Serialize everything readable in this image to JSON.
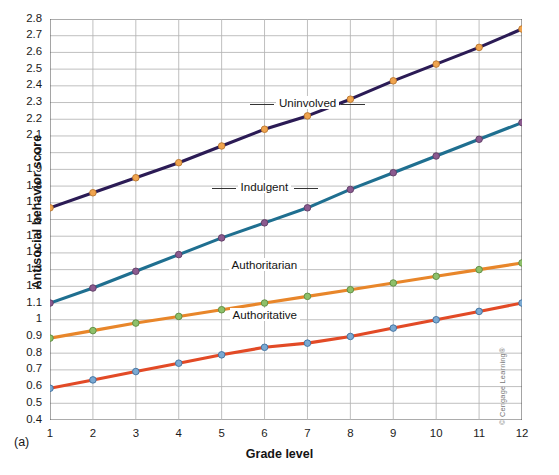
{
  "chart_data": {
    "type": "line",
    "title": "",
    "panel_tag": "(a)",
    "xlabel": "Grade level",
    "ylabel": "Antisocial behavior score",
    "x": [
      1,
      2,
      3,
      4,
      5,
      6,
      7,
      8,
      9,
      10,
      11,
      12
    ],
    "xlim": [
      1,
      12
    ],
    "ylim": [
      0.4,
      2.8
    ],
    "grid": true,
    "legend_position": "inline-annotations",
    "xticklabels": [
      "1",
      "2",
      "3",
      "4",
      "5",
      "6",
      "7",
      "8",
      "9",
      "10",
      "11",
      "12"
    ],
    "yticklabels": [
      "0.4",
      "0.5",
      "0.6",
      "0.7",
      "0.8",
      "0.9",
      "1",
      "1.1",
      "1.2",
      "1.3",
      "1.4",
      "1.5",
      "1.6",
      "1.7",
      "1.8",
      "1.9",
      "2",
      "2.1",
      "2.2",
      "2.3",
      "2.4",
      "2.5",
      "2.6",
      "2.7",
      "2.8"
    ],
    "yticks": [
      0.4,
      0.5,
      0.6,
      0.7,
      0.8,
      0.9,
      1.0,
      1.1,
      1.2,
      1.3,
      1.4,
      1.5,
      1.6,
      1.7,
      1.8,
      1.9,
      2.0,
      2.1,
      2.2,
      2.3,
      2.4,
      2.5,
      2.6,
      2.7,
      2.8
    ],
    "series": [
      {
        "name": "Uninvolved",
        "line_color": "#2b1b55",
        "marker_color": "#f0a44e",
        "marker_edge": "#b9762f",
        "label_x": 7,
        "label_y": 2.29,
        "values": [
          1.67,
          1.76,
          1.85,
          1.94,
          2.04,
          2.14,
          2.22,
          2.32,
          2.43,
          2.53,
          2.63,
          2.74
        ]
      },
      {
        "name": "Indulgent",
        "line_color": "#1f6f90",
        "marker_color": "#8b5a8f",
        "marker_edge": "#5e3c64",
        "label_x": 6,
        "label_y": 1.79,
        "values": [
          1.1,
          1.19,
          1.29,
          1.39,
          1.49,
          1.58,
          1.67,
          1.78,
          1.88,
          1.98,
          2.08,
          2.18
        ]
      },
      {
        "name": "Authoritarian",
        "line_color": "#e8862a",
        "marker_color": "#8dc06a",
        "marker_edge": "#5d8a3f",
        "label_x": 6,
        "label_y": 1.32,
        "values": [
          0.89,
          0.935,
          0.98,
          1.02,
          1.06,
          1.1,
          1.14,
          1.18,
          1.22,
          1.26,
          1.3,
          1.34
        ]
      },
      {
        "name": "Authoritative",
        "line_color": "#e24a26",
        "marker_color": "#7aa9d2",
        "marker_edge": "#3f6f9e",
        "label_x": 6,
        "label_y": 1.02,
        "values": [
          0.59,
          0.64,
          0.69,
          0.74,
          0.79,
          0.835,
          0.86,
          0.9,
          0.95,
          1.0,
          1.05,
          1.1
        ]
      }
    ]
  },
  "copyright": "© Cengage Learning®"
}
